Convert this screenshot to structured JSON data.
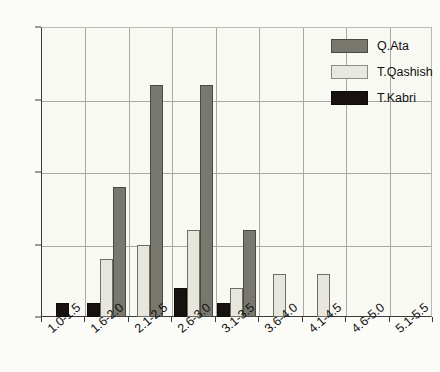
{
  "chart_data": {
    "type": "bar",
    "title": "",
    "xlabel": "",
    "ylabel": "",
    "categories": [
      "1.0-1.5",
      "1.6-2.0",
      "2.1-2.5",
      "2.6-3.0",
      "3.1-3.5",
      "3.6-4.0",
      "4.1-4.5",
      "4.6-5.0",
      "5.1-5.5"
    ],
    "series": [
      {
        "name": "Q.Ata",
        "color": "#78786f",
        "values": [
          0,
          9,
          16,
          16,
          6,
          0,
          0,
          0,
          0
        ]
      },
      {
        "name": "T.Qashish",
        "color": "#e8e8e0",
        "values": [
          0,
          4,
          5,
          6,
          2,
          3,
          3,
          0,
          0
        ]
      },
      {
        "name": "T.Kabri",
        "color": "#171210",
        "values": [
          1,
          1,
          0,
          2,
          1,
          0,
          0,
          0,
          0
        ]
      }
    ],
    "bar_order": [
      "T.Kabri",
      "T.Qashish",
      "Q.Ata"
    ],
    "ylim": [
      0,
      20
    ],
    "yticks": [
      0,
      5,
      10,
      15,
      20
    ],
    "ytick_labels": [
      "0",
      "5",
      "10",
      "15",
      "20"
    ],
    "grid": true,
    "legend_position": "top-right",
    "background_color": "#f9f9f4",
    "axis_color": "#3a3a38",
    "grid_color": "#a9a9a1"
  },
  "legend": {
    "entries": [
      {
        "label": "Q.Ata"
      },
      {
        "label": "T.Qashish"
      },
      {
        "label": "T.Kabri"
      }
    ]
  }
}
